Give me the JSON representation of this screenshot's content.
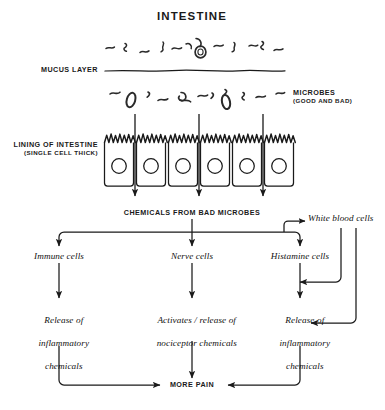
{
  "diagram": {
    "title": "INTESTINE",
    "labels": {
      "mucus_layer": "MUCUS LAYER",
      "microbes_line1": "MICROBES",
      "microbes_line2": "(GOOD AND BAD)",
      "lining_line1": "LINING OF INTESTINE",
      "lining_line2": "(SINGLE CELL THICK)",
      "chemicals": "CHEMICALS FROM BAD MICROBES"
    },
    "nodes": {
      "white_blood_cells": "White blood cells",
      "immune_cells": "Immune cells",
      "nerve_cells": "Nerve cells",
      "histamine_cells": "Histamine cells",
      "immune_release_l1": "Release of",
      "immune_release_l2": "inflammatory",
      "immune_release_l3": "chemicals",
      "nerve_release_l1": "Activates / release of",
      "nerve_release_l2": "nociceptor chemicals",
      "histamine_release_l1": "Release of",
      "histamine_release_l2": "inflammatory",
      "histamine_release_l3": "chemicals",
      "more_pain": "MORE PAIN"
    },
    "anatomy": {
      "cell_count": 6,
      "transit_arrow_count": 3,
      "mucus_microbe_count": 12,
      "lumen_microbe_count": 11
    },
    "colors": {
      "ink": "#111111",
      "paper": "#ffffff",
      "line": "#1a1a1a"
    }
  }
}
